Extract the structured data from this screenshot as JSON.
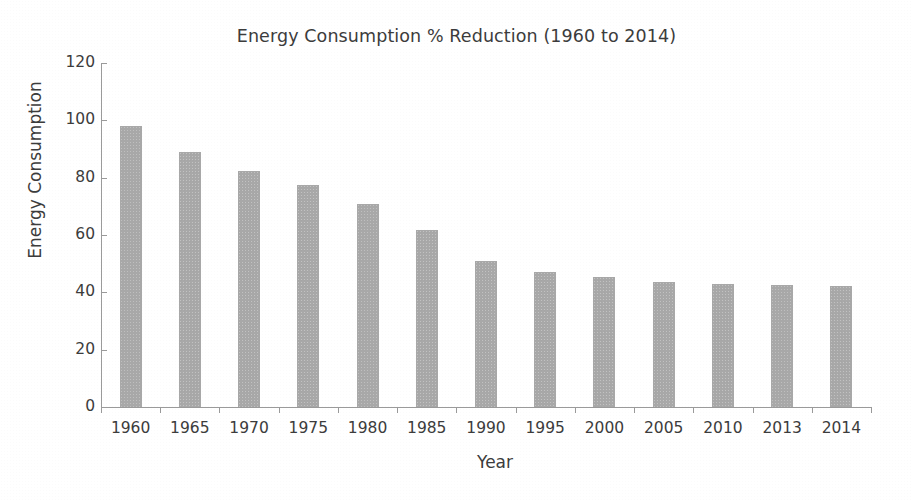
{
  "chart_data": {
    "type": "bar",
    "title": "Energy Consumption % Reduction (1960 to 2014)",
    "xlabel": "Year",
    "ylabel": "Energy Consumption",
    "categories": [
      "1960",
      "1965",
      "1970",
      "1975",
      "1980",
      "1985",
      "1990",
      "1995",
      "2000",
      "2005",
      "2010",
      "2013",
      "2014"
    ],
    "values": [
      98,
      89,
      82.3,
      77.5,
      70.7,
      61.7,
      50.8,
      47,
      45.4,
      43.5,
      42.8,
      42.4,
      42.1
    ],
    "ylim": [
      0,
      120
    ],
    "yticks": [
      "0",
      "20",
      "40",
      "60",
      "80",
      "100",
      "120"
    ],
    "ytick_values": [
      0,
      20,
      40,
      60,
      80,
      100,
      120
    ],
    "grid": false,
    "legend": null,
    "bar_color": "#a8a8a8",
    "axis_color": "#9a9a9a",
    "text_color": "#3c3c3c"
  }
}
